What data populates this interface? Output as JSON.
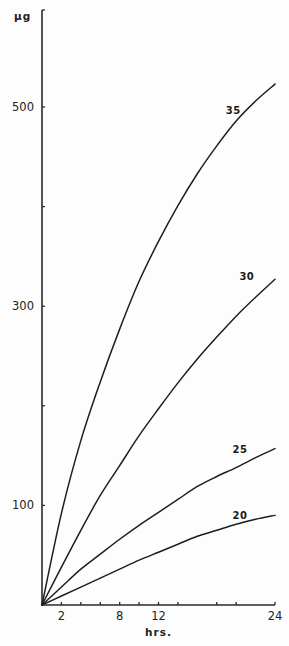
{
  "chart_data": {
    "type": "line",
    "title": "",
    "xlabel": "hrs.",
    "ylabel": "μg",
    "xlim": [
      0,
      24
    ],
    "ylim": [
      0,
      600
    ],
    "grid": false,
    "legend": "inline labels near curve ends",
    "x": [
      0,
      2,
      4,
      6,
      8,
      10,
      12,
      14,
      16,
      18,
      20,
      22,
      24
    ],
    "xticks": [
      2,
      4,
      6,
      8,
      10,
      12,
      14,
      18,
      20,
      24
    ],
    "xtick_labels": [
      {
        "value": 2,
        "label": "2"
      },
      {
        "value": 8,
        "label": "8"
      },
      {
        "value": 12,
        "label": "12"
      },
      {
        "value": 24,
        "label": "24"
      }
    ],
    "yticks": [
      100,
      200,
      300,
      400,
      500,
      600
    ],
    "ytick_labels": [
      {
        "value": 100,
        "label": "100"
      },
      {
        "value": 300,
        "label": "300"
      },
      {
        "value": 500,
        "label": "500"
      }
    ],
    "series": [
      {
        "name": "35",
        "values": [
          0,
          92,
          165,
          224,
          277,
          325,
          365,
          401,
          433,
          461,
          486,
          506,
          523
        ],
        "label_at": {
          "x": 19.7,
          "y": 497
        }
      },
      {
        "name": "30",
        "values": [
          0,
          38,
          75,
          110,
          140,
          170,
          197,
          223,
          247,
          269,
          290,
          309,
          327
        ],
        "label_at": {
          "x": 21.1,
          "y": 330
        }
      },
      {
        "name": "25",
        "values": [
          0,
          18,
          36,
          51,
          66,
          80,
          93,
          106,
          119,
          129,
          138,
          148,
          157
        ],
        "label_at": {
          "x": 20.4,
          "y": 157
        }
      },
      {
        "name": "20",
        "values": [
          0,
          9,
          18,
          27,
          36,
          45,
          53,
          61,
          69,
          75,
          81,
          86,
          90
        ],
        "label_at": {
          "x": 20.4,
          "y": 90
        }
      }
    ],
    "colors": {
      "line": "#1e1e1e",
      "background": "#fdfdfd"
    }
  }
}
